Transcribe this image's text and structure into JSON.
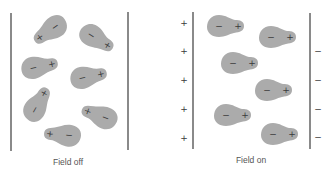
{
  "panels": [
    {
      "id": "field-off",
      "caption": "Field off",
      "caption_pos": {
        "x": 68,
        "y": 157
      },
      "plates": [
        {
          "x": 11,
          "y1": 13,
          "y2": 151
        },
        {
          "x": 128,
          "y1": 12,
          "y2": 150
        }
      ],
      "plate_charges": [],
      "molecules": [
        {
          "cx": 48,
          "cy": 32,
          "angle": 145,
          "neg": "−",
          "pos": "+"
        },
        {
          "cx": 99,
          "cy": 40,
          "angle": 32,
          "neg": "−",
          "pos": "+"
        },
        {
          "cx": 42,
          "cy": 66,
          "angle": -12,
          "neg": "−",
          "pos": "+"
        },
        {
          "cx": 91,
          "cy": 76,
          "angle": -12,
          "neg": "−",
          "pos": "+"
        },
        {
          "cx": 39,
          "cy": 102,
          "angle": -60,
          "neg": "−",
          "pos": "+"
        },
        {
          "cx": 97,
          "cy": 115,
          "angle": 200,
          "neg": "−",
          "pos": "+"
        },
        {
          "cx": 60,
          "cy": 135,
          "angle": 185,
          "neg": "−",
          "pos": "+"
        }
      ]
    },
    {
      "id": "field-on",
      "caption": "Field on",
      "caption_pos": {
        "x": 251,
        "y": 155
      },
      "plates": [
        {
          "x": 193,
          "y1": 12,
          "y2": 149
        },
        {
          "x": 310,
          "y1": 13,
          "y2": 149
        }
      ],
      "plate_charges": [
        {
          "x": 184,
          "y": 23,
          "sign": "+"
        },
        {
          "x": 184,
          "y": 51,
          "sign": "+"
        },
        {
          "x": 184,
          "y": 80,
          "sign": "+"
        },
        {
          "x": 184,
          "y": 109,
          "sign": "+"
        },
        {
          "x": 184,
          "y": 138,
          "sign": "+"
        },
        {
          "x": 318,
          "y": 51,
          "sign": "−"
        },
        {
          "x": 318,
          "y": 80,
          "sign": "−"
        },
        {
          "x": 318,
          "y": 109,
          "sign": "−"
        },
        {
          "x": 318,
          "y": 137,
          "sign": "−"
        }
      ],
      "molecules": [
        {
          "cx": 228,
          "cy": 26,
          "angle": 0,
          "neg": "−",
          "pos": "+"
        },
        {
          "cx": 280,
          "cy": 37,
          "angle": 0,
          "neg": "−",
          "pos": "+"
        },
        {
          "cx": 242,
          "cy": 63,
          "angle": 0,
          "neg": "−",
          "pos": "+"
        },
        {
          "cx": 276,
          "cy": 90,
          "angle": 0,
          "neg": "−",
          "pos": "+"
        },
        {
          "cx": 235,
          "cy": 115,
          "angle": 0,
          "neg": "−",
          "pos": "+"
        },
        {
          "cx": 282,
          "cy": 134,
          "angle": 0,
          "neg": "−",
          "pos": "+"
        }
      ]
    }
  ],
  "colors": {
    "molecule": "#ababab",
    "plate": "#8a8a8a",
    "sign": "#3a3a3a",
    "caption": "#555555"
  }
}
